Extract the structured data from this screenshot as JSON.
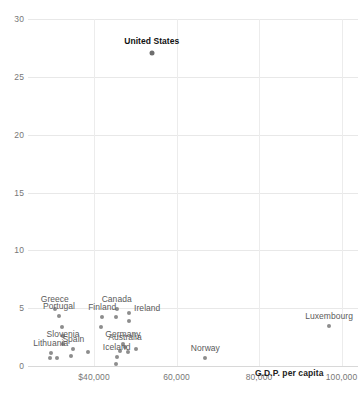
{
  "chart_data": {
    "type": "scatter",
    "title": "",
    "xlabel": "G.D.P. per capita",
    "ylabel": "",
    "xlim": [
      24000,
      104000
    ],
    "ylim": [
      0,
      30
    ],
    "grid": true,
    "legend": false,
    "x_tick_labels": [
      "$40,000",
      "60,000",
      "80,000",
      "100,000"
    ],
    "x_ticks": [
      40000,
      60000,
      80000,
      100000
    ],
    "y_tick_labels": [
      "0",
      "5",
      "10",
      "15",
      "20",
      "25",
      "30"
    ],
    "y_ticks": [
      0,
      5,
      10,
      15,
      20,
      25,
      30
    ],
    "points": [
      {
        "label": "United States",
        "x": 54000,
        "y": 27.1,
        "highlight": true,
        "label_dx": 0,
        "label_dy": -8,
        "anchor": "middle"
      },
      {
        "label": "Greece",
        "x": 30500,
        "y": 4.9,
        "highlight": false,
        "label_dx": 0,
        "label_dy": -6,
        "anchor": "middle"
      },
      {
        "label": "Portugal",
        "x": 31500,
        "y": 4.3,
        "highlight": false,
        "label_dx": 0,
        "label_dy": -6,
        "anchor": "middle"
      },
      {
        "label": "Canada",
        "x": 45500,
        "y": 4.9,
        "highlight": false,
        "label_dx": 0,
        "label_dy": -6,
        "anchor": "middle"
      },
      {
        "label": "Ireland",
        "x": 48500,
        "y": 4.6,
        "highlight": false,
        "label_dx": 5,
        "label_dy": -1,
        "anchor": "start"
      },
      {
        "label": "Finland",
        "x": 42000,
        "y": 4.2,
        "highlight": false,
        "label_dx": 0,
        "label_dy": -6,
        "anchor": "middle"
      },
      {
        "label": "Slovenia",
        "x": 32500,
        "y": 1.9,
        "highlight": false,
        "label_dx": 0,
        "label_dy": -6,
        "anchor": "middle"
      },
      {
        "label": "Spain",
        "x": 35000,
        "y": 1.5,
        "highlight": false,
        "label_dx": 0,
        "label_dy": -6,
        "anchor": "middle"
      },
      {
        "label": "Lithuania",
        "x": 29500,
        "y": 1.1,
        "highlight": false,
        "label_dx": 0,
        "label_dy": -6,
        "anchor": "middle"
      },
      {
        "label": "Germany",
        "x": 47000,
        "y": 1.9,
        "highlight": false,
        "label_dx": 0,
        "label_dy": -6,
        "anchor": "middle"
      },
      {
        "label": "Australia",
        "x": 47500,
        "y": 1.6,
        "highlight": false,
        "label_dx": 0,
        "label_dy": -6,
        "anchor": "middle"
      },
      {
        "label": "Iceland",
        "x": 45500,
        "y": 0.8,
        "highlight": false,
        "label_dx": 0,
        "label_dy": -6,
        "anchor": "middle"
      },
      {
        "label": "Norway",
        "x": 67000,
        "y": 0.7,
        "highlight": false,
        "label_dx": 0,
        "label_dy": -6,
        "anchor": "middle"
      },
      {
        "label": "Luxembourg",
        "x": 97000,
        "y": 3.5,
        "highlight": false,
        "label_dx": 0,
        "label_dy": -6,
        "anchor": "middle"
      }
    ],
    "unlabeled_points": [
      {
        "x": 32200,
        "y": 3.4
      },
      {
        "x": 32600,
        "y": 2.6
      },
      {
        "x": 29300,
        "y": 0.7
      },
      {
        "x": 31000,
        "y": 0.7
      },
      {
        "x": 34500,
        "y": 0.9
      },
      {
        "x": 38500,
        "y": 1.2
      },
      {
        "x": 41700,
        "y": 3.4
      },
      {
        "x": 45300,
        "y": 4.2
      },
      {
        "x": 48600,
        "y": 3.9
      },
      {
        "x": 46200,
        "y": 1.3
      },
      {
        "x": 48300,
        "y": 1.2
      },
      {
        "x": 50200,
        "y": 1.5
      },
      {
        "x": 45400,
        "y": 0.2
      }
    ]
  }
}
